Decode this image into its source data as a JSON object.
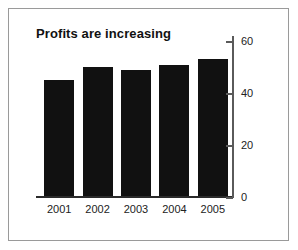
{
  "figure": {
    "background_color": "#ffffff",
    "frame_color": "#9a9a9a",
    "bar_color": "#111111",
    "axis_color": "#5a5a5a",
    "text_color": "#222222"
  },
  "chart_data": {
    "type": "bar",
    "title": "Profits are increasing",
    "xlabel": "",
    "ylabel": "",
    "categories": [
      "2001",
      "2002",
      "2003",
      "2004",
      "2005"
    ],
    "values": [
      45,
      50,
      49,
      51,
      53
    ],
    "ylim": [
      0,
      62
    ],
    "yticks": [
      0,
      20,
      40,
      60
    ],
    "ytick_labels": [
      "0",
      "20",
      "40",
      "60"
    ],
    "grid": false,
    "legend": null,
    "y_axis_position": "right",
    "series": [
      {
        "name": "Profits",
        "values": [
          45,
          50,
          49,
          51,
          53
        ]
      }
    ]
  }
}
